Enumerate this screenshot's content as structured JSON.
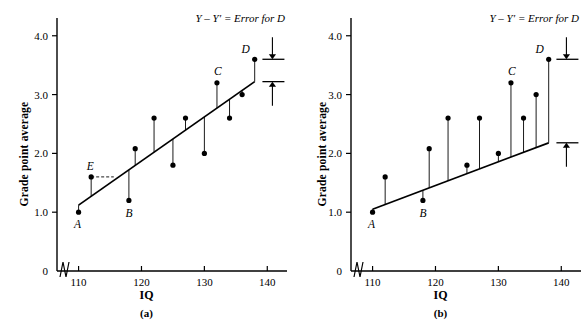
{
  "figure": {
    "axis_color": "#000000",
    "point_color": "#000000",
    "line_color": "#000000",
    "ylabel": "Grade point average",
    "xlabel": "IQ",
    "y_ticks": [
      "0",
      "1.0",
      "2.0",
      "3.0",
      "4.0"
    ],
    "x_ticks": [
      "110",
      "120",
      "130",
      "140"
    ],
    "annotation": "Y – Y′ = Error for D"
  },
  "chart_data": [
    {
      "type": "scatter",
      "panel": "(a)",
      "title": "",
      "xlabel": "IQ",
      "ylabel": "Grade point average",
      "xlim": [
        108,
        142
      ],
      "ylim": [
        0,
        4.2
      ],
      "x_ticks": [
        110,
        120,
        130,
        140
      ],
      "y_ticks": [
        0,
        1.0,
        2.0,
        3.0,
        4.0
      ],
      "grid": false,
      "axis_break_x": true,
      "legend": "none",
      "annotation": "Y – Y′ = Error for D",
      "points": [
        {
          "x": 110,
          "y": 1.0,
          "label": "A"
        },
        {
          "x": 112,
          "y": 1.6,
          "label": "E"
        },
        {
          "x": 118,
          "y": 1.2,
          "label": "B"
        },
        {
          "x": 119,
          "y": 2.08,
          "label": ""
        },
        {
          "x": 122,
          "y": 2.6,
          "label": ""
        },
        {
          "x": 125,
          "y": 1.8,
          "label": ""
        },
        {
          "x": 127,
          "y": 2.6,
          "label": ""
        },
        {
          "x": 130,
          "y": 2.0,
          "label": ""
        },
        {
          "x": 132,
          "y": 3.2,
          "label": "C"
        },
        {
          "x": 134,
          "y": 2.6,
          "label": ""
        },
        {
          "x": 136,
          "y": 3.0,
          "label": ""
        },
        {
          "x": 138,
          "y": 3.6,
          "label": "D"
        }
      ],
      "regression_line": {
        "x1": 110,
        "y1": 1.12,
        "x2": 138,
        "y2": 3.22
      },
      "residuals_drawn": true,
      "dashed_guide": {
        "from_x": 112,
        "from_y": 1.6,
        "to_x": 115.6,
        "to_y": 1.6
      },
      "error_marker": {
        "top_y": 3.6,
        "bottom_y": 3.22,
        "at_x": 140.5
      }
    },
    {
      "type": "scatter",
      "panel": "(b)",
      "title": "",
      "xlabel": "IQ",
      "ylabel": "Grade point average",
      "xlim": [
        108,
        142
      ],
      "ylim": [
        0,
        4.2
      ],
      "x_ticks": [
        110,
        120,
        130,
        140
      ],
      "y_ticks": [
        0,
        1.0,
        2.0,
        3.0,
        4.0
      ],
      "grid": false,
      "axis_break_x": true,
      "legend": "none",
      "annotation": "Y – Y′ = Error for D",
      "points": [
        {
          "x": 110,
          "y": 1.0,
          "label": "A"
        },
        {
          "x": 112,
          "y": 1.6,
          "label": ""
        },
        {
          "x": 118,
          "y": 1.2,
          "label": "B"
        },
        {
          "x": 119,
          "y": 2.08,
          "label": ""
        },
        {
          "x": 122,
          "y": 2.6,
          "label": ""
        },
        {
          "x": 125,
          "y": 1.8,
          "label": ""
        },
        {
          "x": 127,
          "y": 2.6,
          "label": ""
        },
        {
          "x": 130,
          "y": 2.0,
          "label": ""
        },
        {
          "x": 132,
          "y": 3.2,
          "label": "C"
        },
        {
          "x": 134,
          "y": 2.6,
          "label": ""
        },
        {
          "x": 136,
          "y": 3.0,
          "label": ""
        },
        {
          "x": 138,
          "y": 3.6,
          "label": "D"
        }
      ],
      "regression_line": {
        "x1": 110,
        "y1": 1.05,
        "x2": 138,
        "y2": 2.18
      },
      "residuals_drawn": true,
      "dashed_guide": null,
      "error_marker": {
        "top_y": 3.6,
        "bottom_y": 2.18,
        "at_x": 140.5
      }
    }
  ]
}
